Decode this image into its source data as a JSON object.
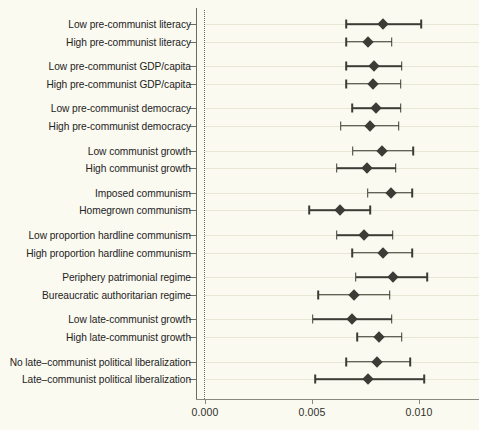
{
  "chart_data": {
    "type": "scatter",
    "title": "",
    "xlabel": "",
    "ylabel": "",
    "xlim": [
      0.0,
      0.0128
    ],
    "xticks": [
      0.0,
      0.005,
      0.01
    ],
    "xtick_labels": [
      "0.000",
      "0.005",
      "0.010"
    ],
    "grid": true,
    "legend": "none",
    "orientation": "horizontal",
    "marker": "diamond",
    "zero_reference_line": 0.0,
    "categories": [
      "Low pre-communist literacy",
      "High pre-communist literacy",
      "Low pre-communist GDP/capita",
      "High pre-communist GDP/capita",
      "Low pre-communist democracy",
      "High pre-communist democracy",
      "Low communist growth",
      "High communist growth",
      "Imposed communism",
      "Homegrown communism",
      "Low proportion hardline communism",
      "High proportion hardline communism",
      "Periphery patrimonial regime",
      "Bureaucratic authoritarian regime",
      "Low late-communist growth",
      "High late-communist growth",
      "No late–communist political liberalization",
      "Late–communist political liberalization"
    ],
    "groups": [
      [
        "Low pre-communist literacy",
        "High pre-communist literacy"
      ],
      [
        "Low pre-communist GDP/capita",
        "High pre-communist GDP/capita"
      ],
      [
        "Low pre-communist democracy",
        "High pre-communist democracy"
      ],
      [
        "Low communist growth",
        "High communist growth"
      ],
      [
        "Imposed communism",
        "Homegrown communism"
      ],
      [
        "Low proportion hardline communism",
        "High proportion hardline communism"
      ],
      [
        "Periphery patrimonial regime",
        "Bureaucratic authoritarian regime"
      ],
      [
        "Low late-communist growth",
        "High late-communist growth"
      ],
      [
        "No late–communist political liberalization",
        "Late–communist political liberalization"
      ]
    ],
    "estimates": [
      0.00832,
      0.00762,
      0.0079,
      0.00785,
      0.00799,
      0.00771,
      0.00827,
      0.00757,
      0.00869,
      0.00631,
      0.00743,
      0.00832,
      0.00878,
      0.00696,
      0.00687,
      0.00813,
      0.00803,
      0.00761
    ],
    "ci_low": [
      0.00659,
      0.00659,
      0.00659,
      0.00659,
      0.00687,
      0.00635,
      0.00691,
      0.00616,
      0.00761,
      0.00486,
      0.00616,
      0.00687,
      0.00705,
      0.00528,
      0.00504,
      0.0071,
      0.00659,
      0.00514
    ],
    "ci_high": [
      0.01009,
      0.00873,
      0.0092,
      0.00915,
      0.00915,
      0.00906,
      0.00972,
      0.00892,
      0.00967,
      0.00771,
      0.00878,
      0.00967,
      0.01037,
      0.00864,
      0.00873,
      0.0092,
      0.00958,
      0.01023
    ],
    "series_name": "Point estimate with 95% confidence interval"
  },
  "axis": {
    "tick_0": "0.000",
    "tick_1": "0.005",
    "tick_2": "0.010"
  },
  "colors": {
    "background": "#fbfaf0",
    "marker": "#3c3c36",
    "grid": "#e8e7d6",
    "axis": "#6b6b60",
    "text": "#23231e",
    "accent_warm": "#6e4f4a"
  }
}
